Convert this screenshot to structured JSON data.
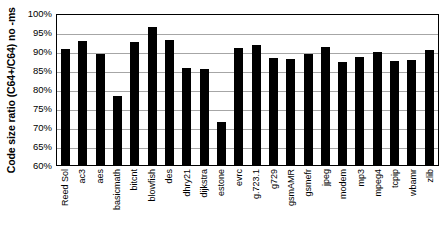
{
  "chart_data": {
    "type": "bar",
    "title": "",
    "xlabel": "",
    "ylabel": "Code size ratio (C64+/C64) no -ms",
    "ylim": [
      60,
      100
    ],
    "ytick_labels": [
      "100%",
      "95%",
      "90%",
      "85%",
      "80%",
      "75%",
      "70%",
      "65%",
      "60%"
    ],
    "ytick_values": [
      100,
      95,
      90,
      85,
      80,
      75,
      70,
      65,
      60
    ],
    "grid": true,
    "legend": "none",
    "bar_color": "#000000",
    "categories": [
      "Reed Sol",
      "ac3",
      "aes",
      "basicmath",
      "bitcnt",
      "blowfish",
      "des",
      "dhry21",
      "dijkstra",
      "estone",
      "evrc",
      "g.723.1",
      "g729",
      "gsmAMR",
      "gsmefr",
      "jpeg",
      "modem",
      "mp3",
      "mpeg4",
      "tcpip",
      "wbamr",
      "zlib"
    ],
    "values": [
      90.6,
      92.7,
      89.3,
      78.1,
      92.4,
      96.2,
      92.8,
      85.4,
      85.3,
      71.3,
      90.9,
      91.5,
      88.1,
      87.8,
      89.1,
      91.1,
      87.0,
      88.5,
      89.7,
      87.3,
      87.6,
      90.2
    ],
    "value_unit": "%"
  }
}
